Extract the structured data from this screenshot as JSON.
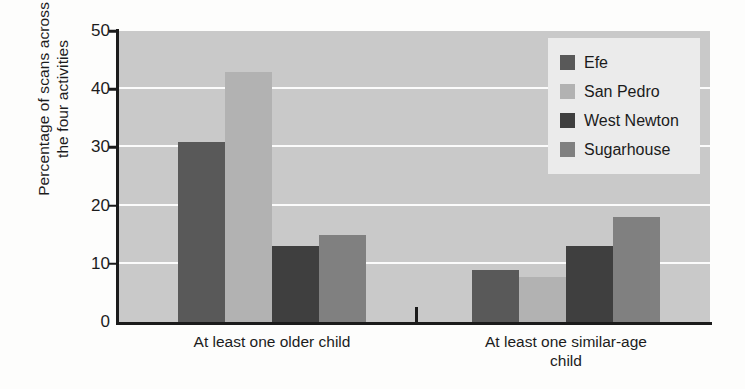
{
  "chart_data": {
    "type": "bar",
    "title": "",
    "xlabel": "",
    "ylabel": "Percentage of scans across the four activities",
    "ylabel_lines": [
      "Percentage of scans across",
      "the four activities"
    ],
    "categories": [
      "At least one older child",
      "At least one similar-age child"
    ],
    "category_label_lines": [
      [
        "At least one older child"
      ],
      [
        "At least one similar-age",
        "child"
      ]
    ],
    "series": [
      {
        "name": "Efe",
        "color": "#595959",
        "values": [
          31,
          9
        ]
      },
      {
        "name": "San Pedro",
        "color": "#b2b2b2",
        "values": [
          43,
          7.8
        ]
      },
      {
        "name": "West Newton",
        "color": "#3f3f3f",
        "values": [
          13,
          13
        ]
      },
      {
        "name": "Sugarhouse",
        "color": "#808080",
        "values": [
          15,
          18
        ]
      }
    ],
    "ylim": [
      0,
      50
    ],
    "yticks": [
      0,
      10,
      20,
      30,
      40,
      50
    ],
    "ytick_labels": [
      "0",
      "10",
      "20",
      "30",
      "40",
      "50"
    ],
    "grid": true,
    "gridlines_at": [
      10,
      20,
      30,
      40
    ],
    "grid_color": "#fbfbfb",
    "plot_background": "#c9c9c9",
    "figure_background": "#fdfdfc",
    "axis_color": "#1b1b1b",
    "legend_position": "top-right",
    "legend_background": "#ebebeb"
  },
  "legend": {
    "entries": [
      {
        "label": "Efe"
      },
      {
        "label": "San Pedro"
      },
      {
        "label": "West Newton"
      },
      {
        "label": "Sugarhouse"
      }
    ]
  }
}
